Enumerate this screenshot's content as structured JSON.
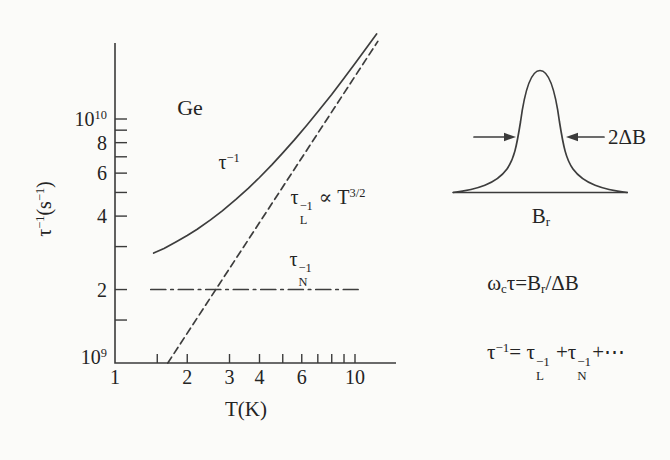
{
  "figure": {
    "background": "#fbfbf9",
    "ink": "#3b3b3b"
  },
  "chart_data": {
    "type": "line",
    "title": "",
    "material_label": "Ge",
    "xlabel": "T(K)",
    "ylabel_segments": [
      {
        "t": "τ"
      },
      {
        "sup": "−1"
      },
      {
        "t": "(s"
      },
      {
        "sup": "−1"
      },
      {
        "t": ")"
      }
    ],
    "x_scale": "log",
    "y_scale": "log",
    "xlim": [
      1,
      14.7
    ],
    "ylim_s_inverse": [
      1000000000.0,
      21000000000.0
    ],
    "grid": false,
    "legend": "inline-labels",
    "x_ticks": [
      1.5,
      2,
      3,
      4,
      5,
      6,
      7,
      8,
      9,
      10
    ],
    "x_tick_labels": [
      {
        "v": 1,
        "t": "1"
      },
      {
        "v": 2,
        "t": "2"
      },
      {
        "v": 3,
        "t": "3"
      },
      {
        "v": 4,
        "t": "4"
      },
      {
        "v": 6,
        "t": "6"
      },
      {
        "v": 10,
        "t": "10"
      }
    ],
    "y_ticks_e9": [
      1.5,
      2,
      3,
      4,
      5,
      6,
      7,
      8,
      9,
      10
    ],
    "y_tick_labels": [
      {
        "v": 1,
        "t": "10",
        "sup": "9",
        "dy": -6
      },
      {
        "v": 2,
        "t": "2"
      },
      {
        "v": 4,
        "t": "4"
      },
      {
        "v": 6,
        "t": "6"
      },
      {
        "v": 8,
        "t": "8"
      },
      {
        "v": 10,
        "t": "10",
        "sup": "10"
      }
    ],
    "series": [
      {
        "name": "tau-inverse",
        "style": "solid",
        "label_segments": [
          {
            "t": "τ"
          },
          {
            "sup": "−1"
          }
        ],
        "T": [
          1.45,
          1.6,
          1.8,
          2.0,
          2.2,
          2.5,
          2.8,
          3.2,
          3.6,
          4.0,
          4.5,
          5.0,
          5.6,
          6.3,
          7.0,
          8.0,
          9.0,
          10.0,
          11.0,
          12.3
        ],
        "v_e9": [
          2.82,
          2.95,
          3.14,
          3.33,
          3.53,
          3.86,
          4.2,
          4.69,
          5.21,
          5.76,
          6.49,
          7.26,
          8.23,
          9.43,
          10.7,
          12.6,
          14.7,
          16.9,
          19.2,
          22.3
        ]
      },
      {
        "name": "tau-L-inverse",
        "style": "dashed",
        "label_segments": [
          {
            "t": "τ"
          },
          {
            "stack": [
              "−1",
              "L"
            ]
          },
          {
            "t": " ∝ T"
          },
          {
            "sup": "3/2"
          }
        ],
        "T": [
          1.66,
          12.45
        ],
        "v_e9": [
          1.0,
          20.8
        ]
      },
      {
        "name": "tau-N-inverse",
        "style": "dashdot",
        "label_segments": [
          {
            "t": "τ"
          },
          {
            "stack": [
              "−1",
              "N"
            ]
          }
        ],
        "T": [
          1.41,
          10.3
        ],
        "v_e9": [
          2.0,
          2.0
        ]
      }
    ]
  },
  "inset": {
    "width_label_segments": [
      {
        "t": "2ΔB"
      }
    ],
    "baseline_label_segments": [
      {
        "t": "B"
      },
      {
        "sub": "r"
      }
    ]
  },
  "equations": {
    "eq1_segments": [
      {
        "t": "ω"
      },
      {
        "sub": "c"
      },
      {
        "t": "τ=B"
      },
      {
        "sub": "r"
      },
      {
        "t": "/ΔB"
      }
    ],
    "eq2_segments": [
      {
        "t": "τ"
      },
      {
        "sup": "−1"
      },
      {
        "t": "= τ"
      },
      {
        "stack": [
          "−1",
          "L"
        ]
      },
      {
        "t": " +τ"
      },
      {
        "stack": [
          "−1",
          "N"
        ]
      },
      {
        "t": "+⋯"
      }
    ]
  }
}
